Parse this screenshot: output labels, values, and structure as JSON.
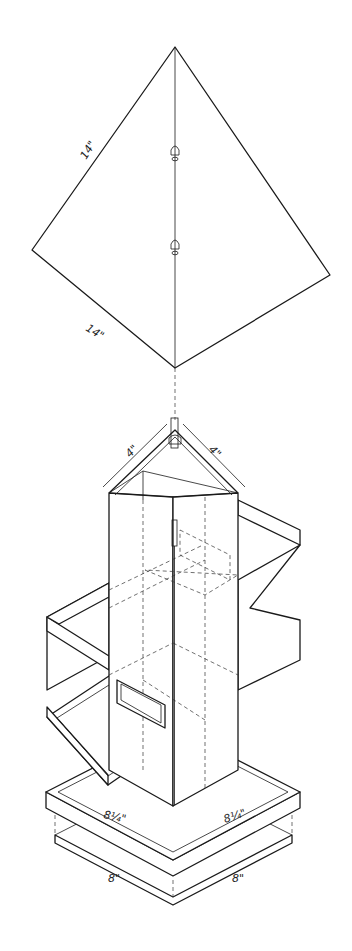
{
  "figure": {
    "roof": {
      "dimension_left_edge": "14\"",
      "dimension_bottom_edge": "14\""
    },
    "hopper_top": {
      "dimension_left": "4\"",
      "dimension_right": "4\""
    },
    "base_tray": {
      "dimension_left_upper": "8¼\"",
      "dimension_right_upper": "8¼\"",
      "dimension_left_lower": "8\"",
      "dimension_right_lower": "8\""
    }
  }
}
